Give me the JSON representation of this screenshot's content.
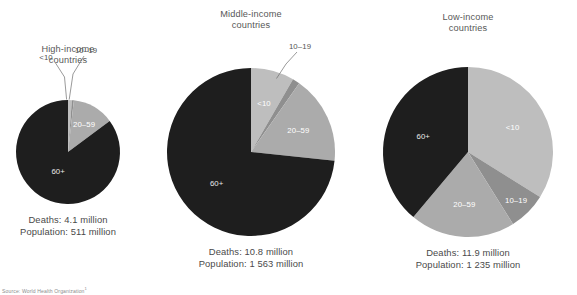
{
  "figure": {
    "source_prefix": "Source: World Health Organization",
    "source_ref": "1"
  },
  "colors": {
    "age_under10": "#bebebe",
    "age_10_19": "#8f8f8f",
    "age_20_59": "#ababab",
    "age_60plus": "#1e1e1e",
    "background": "#ffffff",
    "label_text": "#585858",
    "label_text_light": "#ffffff"
  },
  "chart_data": {
    "type": "pie",
    "legend_position": "none",
    "categories": [
      "<10",
      "10–19",
      "20–59",
      "60+"
    ],
    "charts": [
      {
        "title_line1": "High-income",
        "title_line2": "countries",
        "deaths_label": "Deaths: 4.1 million",
        "population_label": "Population: 511 million",
        "deaths_millions": 4.1,
        "population_millions": 511,
        "radius": 52,
        "cx": 68,
        "cy": 152,
        "slices": [
          {
            "name": "<10",
            "percent": 1.2,
            "angle_deg": 4.3,
            "label": "<10",
            "label_placement": "leader"
          },
          {
            "name": "10–19",
            "percent": 0.6,
            "angle_deg": 2.2,
            "label": "10–19",
            "label_placement": "leader"
          },
          {
            "name": "20–59",
            "percent": 13.0,
            "angle_deg": 46.8,
            "label": "20–59",
            "label_placement": "inside"
          },
          {
            "name": "60+",
            "percent": 85.2,
            "angle_deg": 306.7,
            "label": "60+",
            "label_placement": "inside"
          }
        ]
      },
      {
        "title_line1": "Middle-income",
        "title_line2": "countries",
        "deaths_label": "Deaths: 10.8 million",
        "population_label": "Population: 1 563 million",
        "deaths_millions": 10.8,
        "population_millions": 1563,
        "radius": 84,
        "cx": 251,
        "cy": 152,
        "slices": [
          {
            "name": "<10",
            "percent": 8.3,
            "angle_deg": 30.0,
            "label": "<10",
            "label_placement": "inside"
          },
          {
            "name": "10–19",
            "percent": 1.4,
            "angle_deg": 5.0,
            "label": "10–19",
            "label_placement": "leader"
          },
          {
            "name": "20–59",
            "percent": 17.0,
            "angle_deg": 61.0,
            "label": "20–59",
            "label_placement": "inside"
          },
          {
            "name": "60+",
            "percent": 73.3,
            "angle_deg": 264.0,
            "label": "60+",
            "label_placement": "inside"
          }
        ]
      },
      {
        "title_line1": "Low-income",
        "title_line2": "countries",
        "deaths_label": "Deaths: 11.9 million",
        "population_label": "Population: 1 235 million",
        "deaths_millions": 11.9,
        "population_millions": 1235,
        "radius": 85,
        "cx": 468,
        "cy": 152,
        "slices": [
          {
            "name": "<10",
            "percent": 33.9,
            "angle_deg": 122.0,
            "label": "<10",
            "label_placement": "inside"
          },
          {
            "name": "10–19",
            "percent": 7.2,
            "angle_deg": 26.0,
            "label": "10–19",
            "label_placement": "inside"
          },
          {
            "name": "20–59",
            "percent": 20.0,
            "angle_deg": 72.0,
            "label": "20–59",
            "label_placement": "inside"
          },
          {
            "name": "60+",
            "percent": 38.9,
            "angle_deg": 140.0,
            "label": "60+",
            "label_placement": "inside"
          }
        ]
      }
    ]
  }
}
